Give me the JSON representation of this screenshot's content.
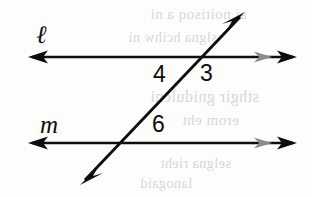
{
  "figure": {
    "background_color": "#fdfdfc",
    "ink_color": "#0d0d0d",
    "faint_arrow_color": "#8c8c8c",
    "bleed_color": "#d8d6d2",
    "width": 312,
    "height": 197
  },
  "lines": [
    {
      "id": "line-l",
      "name": "ℓ",
      "label_x": 36,
      "label_y": 22,
      "y": 57,
      "x_start": 30,
      "x_end": 295,
      "left_arrow": true,
      "right_arrow": true,
      "faint_right_arrow": true
    },
    {
      "id": "line-m",
      "name": "m",
      "label_x": 40,
      "label_y": 112,
      "y": 143,
      "x_start": 30,
      "x_end": 295,
      "left_arrow": true,
      "right_arrow": true,
      "faint_right_arrow": true
    }
  ],
  "transversal": {
    "id": "line-transversal",
    "name": "transversal",
    "x1": 80,
    "y1": 185,
    "x2": 245,
    "y2": 12,
    "start_arrow": true,
    "end_arrow": true
  },
  "intersections": [
    {
      "id": "intersection-upper",
      "with": "line-l",
      "x": 200,
      "y": 57
    },
    {
      "id": "intersection-lower",
      "with": "line-m",
      "x": 122,
      "y": 143
    }
  ],
  "angle_labels": [
    {
      "id": "angle-4",
      "text": "4",
      "x": 153,
      "y": 63,
      "position": "upper-intersection-left-below"
    },
    {
      "id": "angle-3",
      "text": "3",
      "x": 200,
      "y": 62,
      "position": "upper-intersection-right-below"
    },
    {
      "id": "angle-6",
      "text": "6",
      "x": 152,
      "y": 113,
      "position": "lower-intersection-right-above"
    }
  ],
  "bleed_text": [
    {
      "text": "ai noitisoq a ni",
      "x": 150,
      "y": 6,
      "size": 15
    },
    {
      "text": "slgna hcihw ni",
      "x": 128,
      "y": 30,
      "size": 14
    },
    {
      "text": "sthgir gnidulcni",
      "x": 150,
      "y": 88,
      "size": 16
    },
    {
      "text": "erom eht",
      "x": 182,
      "y": 112,
      "size": 15
    },
    {
      "text": "selgna rieht",
      "x": 160,
      "y": 156,
      "size": 14
    },
    {
      "text": "lanogaid",
      "x": 140,
      "y": 176,
      "size": 14
    }
  ]
}
